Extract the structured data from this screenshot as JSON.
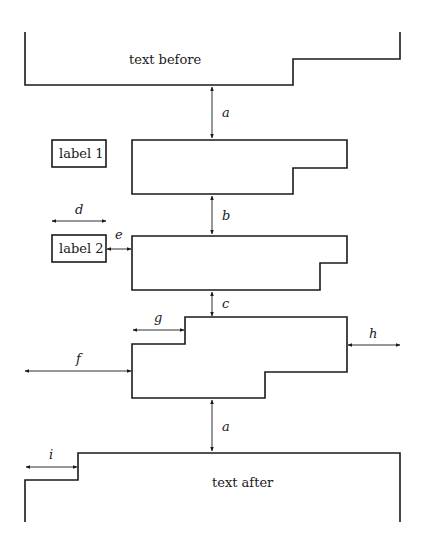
{
  "diagram": {
    "title": "",
    "blocks": {
      "text_before": {
        "label": "text before"
      },
      "text_after": {
        "label": "text after"
      }
    },
    "labels": {
      "label1": "label 1",
      "label2": "label 2"
    },
    "dimensions": {
      "a_top": "a",
      "b": "b",
      "c": "c",
      "d": "d",
      "e": "e",
      "f": "f",
      "g": "g",
      "h": "h",
      "a_bottom": "a",
      "i": "i"
    }
  },
  "colors": {
    "stroke": "#1a1a1a",
    "background": "#ffffff"
  }
}
